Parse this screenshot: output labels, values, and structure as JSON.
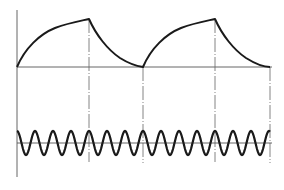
{
  "diagram": {
    "title": "",
    "colors": {
      "line": "#1a1a1a",
      "axis": "#555555",
      "background": "#ffffff"
    },
    "top_plot": {
      "description": "Exponential charge/discharge (sawtooth-like) waveform, two cycles",
      "baseline_y": 67,
      "axis_x": 17,
      "cycles": [
        {
          "rise_start": [
            17,
            67
          ],
          "peak": [
            89,
            19
          ],
          "discharge_end": [
            143,
            67
          ]
        },
        {
          "rise_start": [
            143,
            67
          ],
          "peak": [
            215,
            19
          ],
          "discharge_end": [
            270,
            67
          ]
        }
      ],
      "guide_lines_x": [
        89,
        143,
        215,
        270
      ]
    },
    "bottom_plot": {
      "description": "Sinusoidal carrier waveform",
      "center_y": 143,
      "amplitude": 12,
      "period_px": 18,
      "x_start": 17,
      "x_end": 270
    }
  }
}
